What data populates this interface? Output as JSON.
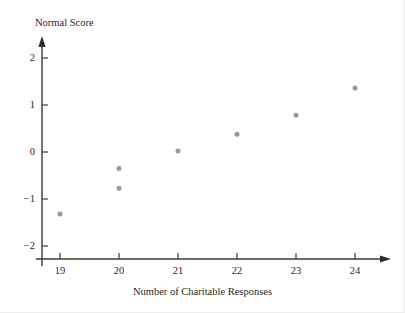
{
  "chart_data": {
    "type": "scatter",
    "title": "",
    "xlabel": "Number of Charitable Responses",
    "ylabel": "Normal Score",
    "xlim": [
      18.6,
      24.6
    ],
    "ylim": [
      -2.25,
      2.3
    ],
    "xticks": [
      19,
      20,
      21,
      22,
      23,
      24
    ],
    "xtick_labels": [
      "19",
      "20",
      "21",
      "22",
      "23",
      "24"
    ],
    "yticks": [
      2,
      1,
      0,
      -1,
      -2
    ],
    "ytick_labels": [
      "2",
      "1",
      "0",
      "−1",
      "−2"
    ],
    "grid": false,
    "legend": null,
    "marker": {
      "shape": "circle",
      "color": "#9a9a9a",
      "size": 5
    },
    "axis_color": "#3a3a3a",
    "background": "#ffffff",
    "x": [
      19,
      20,
      20,
      21,
      22,
      23,
      24
    ],
    "y": [
      -1.32,
      -0.77,
      -0.35,
      0.02,
      0.38,
      0.78,
      1.36
    ],
    "points": [
      {
        "x": 19,
        "y": -1.32
      },
      {
        "x": 20,
        "y": -0.77
      },
      {
        "x": 20,
        "y": -0.35
      },
      {
        "x": 21,
        "y": 0.02
      },
      {
        "x": 22,
        "y": 0.38
      },
      {
        "x": 23,
        "y": 0.78
      },
      {
        "x": 24,
        "y": 1.36
      }
    ]
  }
}
